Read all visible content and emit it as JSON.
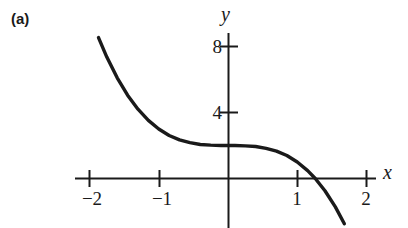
{
  "figure": {
    "panel_label": "(a)",
    "background_color": "#ffffff",
    "ink_color": "#1a1a1a"
  },
  "chart_data": {
    "type": "line",
    "title": "",
    "subtitle": "",
    "xlabel": "x",
    "ylabel": "y",
    "xlim": [
      -2.25,
      2.3
    ],
    "ylim": [
      -1.6,
      8.9
    ],
    "grid": false,
    "legend": null,
    "axes_style": "cartesian-cross",
    "x_ticks": [
      -2,
      -1,
      1,
      2
    ],
    "x_tick_labels": [
      "−2",
      "−1",
      "1",
      "2"
    ],
    "y_ticks": [
      4,
      8
    ],
    "y_tick_labels": [
      "4",
      "8"
    ],
    "series": [
      {
        "name": "curve",
        "equation": "y = 2 − x³",
        "x": [
          -1.87,
          -1.75,
          -1.6,
          -1.45,
          -1.3,
          -1.15,
          -1.0,
          -0.85,
          -0.7,
          -0.55,
          -0.4,
          -0.25,
          -0.1,
          0.0,
          0.1,
          0.25,
          0.4,
          0.55,
          0.7,
          0.85,
          1.0,
          1.15,
          1.26,
          1.4,
          1.55,
          1.68
        ],
        "y": [
          8.54,
          7.36,
          6.1,
          5.05,
          4.2,
          3.52,
          3.0,
          2.61,
          2.34,
          2.17,
          2.06,
          2.02,
          2.0,
          2.0,
          2.0,
          1.98,
          1.94,
          1.83,
          1.66,
          1.39,
          1.0,
          0.48,
          0.0,
          -0.74,
          -1.72,
          -2.74
        ]
      }
    ],
    "annotations": []
  }
}
